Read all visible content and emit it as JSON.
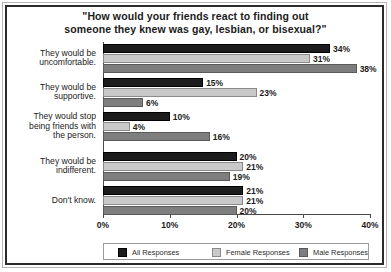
{
  "chart_data": {
    "type": "bar",
    "orientation": "horizontal",
    "title": "\"How would your friends react to finding out someone they knew was gay, lesbian, or bisexual?\"",
    "title_lines": [
      "\"How would your friends react to finding out",
      "someone they knew was gay, lesbian, or bisexual?\""
    ],
    "xlabel": "",
    "ylabel": "",
    "xlim": [
      0,
      40
    ],
    "grid": false,
    "legend_position": "bottom",
    "categories": [
      "They would be uncomfortable.",
      "They would be supportive.",
      "They would stop being friends with the person.",
      "They would be indifferent.",
      "Don't know."
    ],
    "category_lines": [
      [
        "They would be",
        "uncomfortable."
      ],
      [
        "They would be",
        "supportive."
      ],
      [
        "They would stop",
        "being friends with",
        "the person."
      ],
      [
        "They would be",
        "indifferent."
      ],
      [
        "Don't know."
      ]
    ],
    "series": [
      {
        "name": "All Responses",
        "color": "#1c1c1c",
        "values": [
          34,
          15,
          10,
          20,
          21
        ],
        "labels": [
          "34%",
          "15%",
          "10%",
          "20%",
          "21%"
        ]
      },
      {
        "name": "Female Responses",
        "color": "#c9c9c9",
        "values": [
          31,
          23,
          4,
          21,
          21
        ],
        "labels": [
          "31%",
          "23%",
          "4%",
          "21%",
          "21%"
        ]
      },
      {
        "name": "Male Responses",
        "color": "#7e7e7e",
        "values": [
          38,
          6,
          16,
          19,
          20
        ],
        "labels": [
          "38%",
          "6%",
          "16%",
          "19%",
          "20%"
        ]
      }
    ],
    "xticks": [
      0,
      10,
      20,
      30,
      40
    ],
    "xtick_labels": [
      "0%",
      "10%",
      "20%",
      "30%",
      "40%"
    ]
  },
  "legend": {
    "items": [
      {
        "label": "All Responses",
        "key": "all"
      },
      {
        "label": "Female Responses",
        "key": "female"
      },
      {
        "label": "Male Responses",
        "key": "male"
      }
    ]
  }
}
